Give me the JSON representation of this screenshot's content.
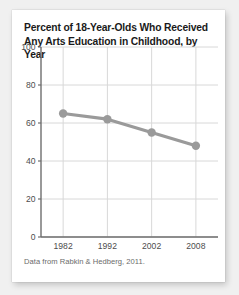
{
  "card": {
    "title_line1": "Percent of 18-Year-Olds Who Received",
    "title_line2": "Any Arts Education in Childhood, by Year",
    "source_note": "Data from Rabkin & Hedberg, 2011."
  },
  "colors": {
    "page_background": "#f0f0f0",
    "card_background": "#ffffff",
    "title_text": "#1a1a1a",
    "tick_text": "#4d4d4d",
    "series_line": "#9a9a9a",
    "marker_fill": "#9a9a9a",
    "gridline": "#d8d8d8",
    "axis_spine": "#6e6e6e",
    "source_text": "#6b6b6b"
  },
  "chart_data": {
    "type": "line",
    "title": "Percent of 18-Year-Olds Who Received Any Arts Education in Childhood, by Year",
    "xlabel": "",
    "ylabel": "",
    "x": [
      1982,
      1992,
      2002,
      2008
    ],
    "xtick_labels": [
      "1982",
      "1992",
      "2002",
      "2008"
    ],
    "values": [
      65,
      62,
      55,
      48
    ],
    "ytick_values": [
      0,
      20,
      40,
      60,
      80,
      100
    ],
    "ytick_labels": [
      "0",
      "20",
      "40",
      "60",
      "80",
      "100"
    ],
    "ylim": [
      0,
      100
    ],
    "xlim": [
      1977,
      2013
    ],
    "grid": true,
    "grid_axis": "both",
    "legend": false,
    "marker": "circle",
    "series": [
      {
        "name": "Percent receiving any arts education",
        "values": [
          65,
          62,
          55,
          48
        ]
      }
    ],
    "annotations": [
      "Data from Rabkin & Hedberg, 2011."
    ]
  }
}
